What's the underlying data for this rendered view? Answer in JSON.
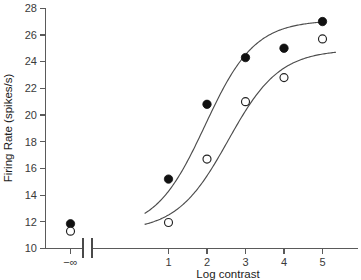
{
  "chart_data": {
    "type": "scatter",
    "title": "",
    "xlabel": "Log contrast",
    "ylabel": "Firing Rate (spikes/s)",
    "xticklabels": [
      "−∞",
      "1",
      "2",
      "3",
      "4",
      "5"
    ],
    "xtickvalues": [
      null,
      1,
      2,
      3,
      4,
      5
    ],
    "yticklabels": [
      "10",
      "12",
      "14",
      "16",
      "18",
      "20",
      "22",
      "24",
      "26",
      "28"
    ],
    "ytickvalues": [
      10,
      12,
      14,
      16,
      18,
      20,
      22,
      24,
      26,
      28
    ],
    "ylim": [
      10,
      28
    ],
    "xlim": [
      0.3,
      5.6
    ],
    "grid": false,
    "legend": false,
    "axis_break": true,
    "axis_break_note": "x-axis broken between -infinity point and log contrast 1",
    "series": [
      {
        "name": "filled",
        "marker": "filled-circle",
        "color": "#111111",
        "x": [
          "-inf",
          1,
          2,
          3,
          4,
          5
        ],
        "y": [
          11.85,
          15.2,
          20.8,
          24.3,
          25.0,
          27.0
        ]
      },
      {
        "name": "open",
        "marker": "open-circle",
        "color": "#ffffff",
        "x": [
          "-inf",
          1,
          2,
          3,
          4,
          5
        ],
        "y": [
          11.3,
          11.95,
          16.7,
          21.0,
          22.8,
          25.7
        ]
      }
    ],
    "fit_curves": [
      {
        "name": "upper-fit",
        "baseline": 11.35,
        "saturation": 27.1,
        "midpoint": 1.95,
        "slope": 1.55
      },
      {
        "name": "lower-fit",
        "baseline": 11.3,
        "saturation": 24.9,
        "midpoint": 2.55,
        "slope": 1.5
      }
    ]
  },
  "axes": {
    "x_title": "Log contrast",
    "y_title": "Firing Rate (spikes/s)"
  }
}
